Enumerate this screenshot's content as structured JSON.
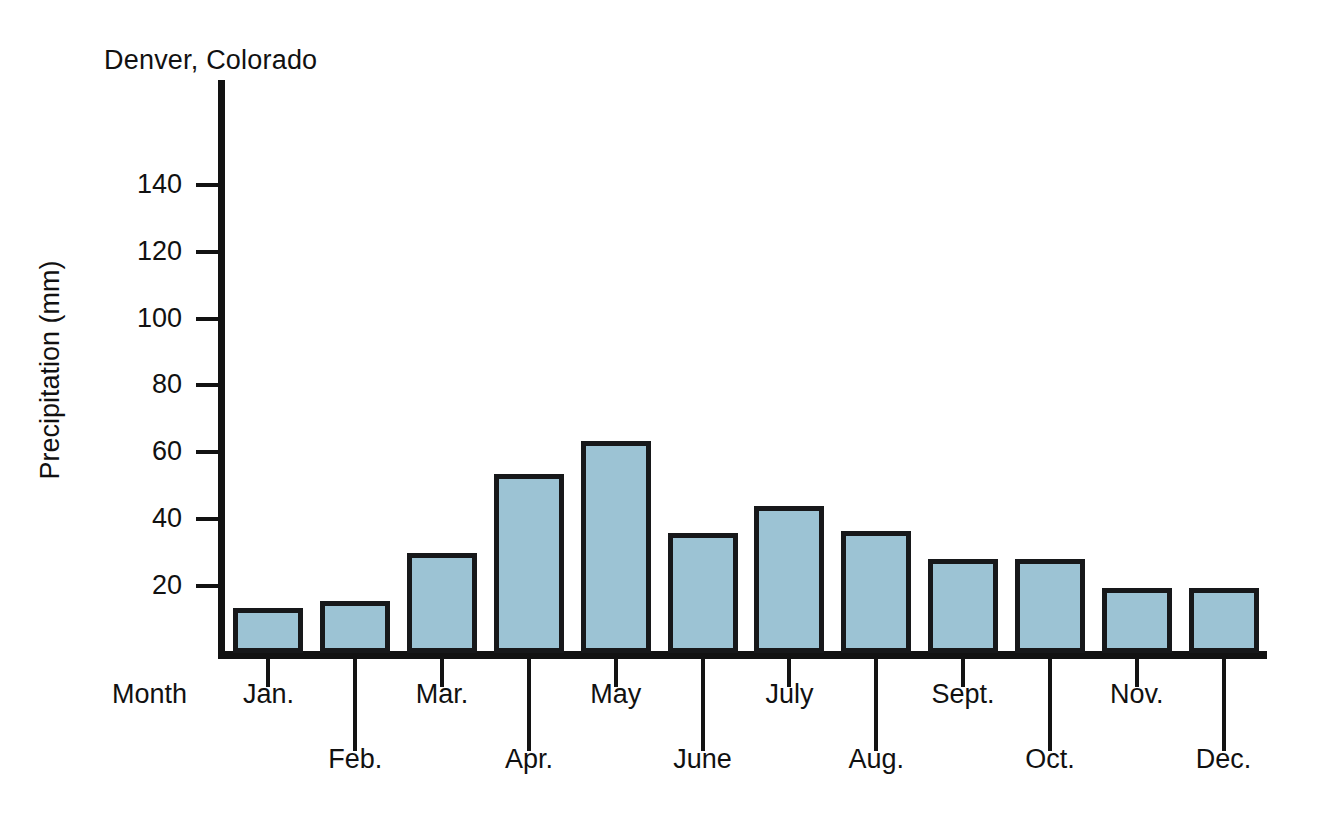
{
  "chart_data": {
    "type": "bar",
    "title": "Denver, Colorado",
    "xlabel": "Month",
    "ylabel": "Precipitation (mm)",
    "categories": [
      "Jan.",
      "Feb.",
      "Mar.",
      "Apr.",
      "May",
      "June",
      "July",
      "Aug.",
      "Sept.",
      "Oct.",
      "Nov.",
      "Dec."
    ],
    "values": [
      13.5,
      15.5,
      30,
      53.5,
      63.5,
      36,
      44,
      36.5,
      28,
      28,
      19.5,
      19.5
    ],
    "ylim": [
      0,
      150
    ],
    "yticks": [
      20,
      40,
      60,
      80,
      100,
      120,
      140
    ],
    "ytick_labels": [
      "20",
      "40",
      "60",
      "80",
      "100",
      "120",
      "140"
    ],
    "grid": false,
    "legend": false,
    "bar_fill_color": "#9cc3d4",
    "bar_edge_color": "#17181a",
    "axis_color": "#121212",
    "background_color": "#ffffff"
  }
}
